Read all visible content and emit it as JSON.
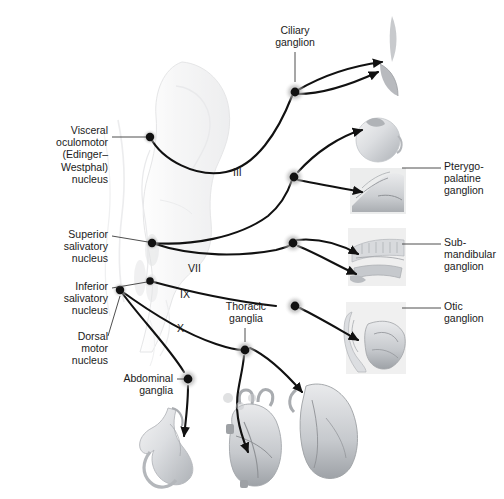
{
  "figure": {
    "background_color": "#ffffff",
    "ink_color": "#1a1a1a",
    "leader_color": "#3a3a3a",
    "anatomy_tint": "#b9bcc0"
  },
  "left_labels": [
    {
      "name": "visceral-oculomotor-nucleus",
      "text": "Visceral\noculomotor\n(Edinger–\nWestphal)\nnucleus",
      "x": 16,
      "y": 124,
      "width": 92,
      "leader": {
        "x1": 112,
        "y1": 137,
        "x2": 148,
        "y2": 137
      }
    },
    {
      "name": "superior-salivatory-nucleus",
      "text": "Superior\nsalivatory\nnucleus",
      "x": 26,
      "y": 228,
      "width": 82,
      "leader": {
        "x1": 112,
        "y1": 236,
        "x2": 151,
        "y2": 243
      }
    },
    {
      "name": "inferior-salivatory-nucleus",
      "text": "Inferior\nsalivatory\nnucleus",
      "x": 26,
      "y": 280,
      "width": 82,
      "leader": {
        "x1": 112,
        "y1": 288,
        "x2": 149,
        "y2": 281
      }
    },
    {
      "name": "dorsal-motor-nucleus",
      "text": "Dorsal\nmotor\nnucleus",
      "x": 30,
      "y": 330,
      "width": 78,
      "leader": {
        "x1": 112,
        "y1": 336,
        "x2": 121,
        "y2": 290
      }
    },
    {
      "name": "abdominal-ganglia",
      "text": "Abdominal\nganglia",
      "x": 97,
      "y": 372,
      "width": 76,
      "leader": {
        "x1": 177,
        "y1": 379,
        "x2": 186,
        "y2": 379
      }
    }
  ],
  "right_labels": [
    {
      "name": "pterygopalatine-ganglion",
      "text": "Pterygo-\npalatine\nganglion",
      "x": 444,
      "y": 160,
      "width": 60,
      "leader": {
        "x1": 400,
        "y1": 168,
        "x2": 440,
        "y2": 168
      }
    },
    {
      "name": "submandibular-ganglion",
      "text": "Sub-\nmandibular\nganglion",
      "x": 444,
      "y": 236,
      "width": 60,
      "leader": {
        "x1": 400,
        "y1": 244,
        "x2": 440,
        "y2": 244
      }
    },
    {
      "name": "otic-ganglion",
      "text": "Otic\nganglion",
      "x": 444,
      "y": 300,
      "width": 60,
      "leader": {
        "x1": 400,
        "y1": 308,
        "x2": 440,
        "y2": 308
      }
    }
  ],
  "top_labels": [
    {
      "name": "ciliary-ganglion",
      "text": "Ciliary\nganglion",
      "x": 266,
      "y": 24,
      "width": 58,
      "leader": {
        "x1": 295,
        "y1": 52,
        "x2": 295,
        "y2": 84
      }
    },
    {
      "name": "thoracic-ganglia",
      "text": "Thoracic\nganglia",
      "x": 216,
      "y": 300,
      "width": 60,
      "leader": {
        "x1": 245,
        "y1": 328,
        "x2": 245,
        "y2": 344
      }
    }
  ],
  "nerve_numerals": [
    {
      "name": "cranial-nerve-iii",
      "text": "III",
      "x": 233,
      "y": 166
    },
    {
      "name": "cranial-nerve-vii",
      "text": "VII",
      "x": 188,
      "y": 262
    },
    {
      "name": "cranial-nerve-ix",
      "text": "IX",
      "x": 180,
      "y": 288
    },
    {
      "name": "cranial-nerve-x",
      "text": "X",
      "x": 177,
      "y": 322
    }
  ],
  "ganglia_nodes": [
    {
      "name": "ciliary-ganglion-node",
      "x": 295,
      "y": 92,
      "halo": true
    },
    {
      "name": "pterygopalatine-ganglion-node",
      "x": 294,
      "y": 177,
      "halo": true
    },
    {
      "name": "submandibular-ganglion-node",
      "x": 293,
      "y": 243,
      "halo": true
    },
    {
      "name": "otic-ganglion-node",
      "x": 295,
      "y": 306,
      "halo": true
    },
    {
      "name": "thoracic-ganglion-node",
      "x": 245,
      "y": 350,
      "halo": true
    },
    {
      "name": "abdominal-ganglion-node",
      "x": 188,
      "y": 379,
      "halo": true
    }
  ],
  "nuclei_nodes": [
    {
      "name": "visceral-oculomotor-nucleus-node",
      "x": 150,
      "y": 137
    },
    {
      "name": "superior-salivatory-nucleus-node",
      "x": 152,
      "y": 243
    },
    {
      "name": "inferior-salivatory-nucleus-node",
      "x": 150,
      "y": 281
    },
    {
      "name": "dorsal-motor-nucleus-node",
      "x": 120,
      "y": 290
    }
  ],
  "organs": [
    {
      "name": "eyelid-lacrimal-gland-image",
      "x": 372,
      "y": 14,
      "w": 34,
      "h": 84
    },
    {
      "name": "eyeball-image",
      "x": 352,
      "y": 112,
      "w": 52,
      "h": 52
    },
    {
      "name": "nasal-cavity-image",
      "x": 350,
      "y": 168,
      "w": 56,
      "h": 46
    },
    {
      "name": "mandible-teeth-image",
      "x": 348,
      "y": 228,
      "w": 58,
      "h": 58
    },
    {
      "name": "ear-parotid-gland-image",
      "x": 346,
      "y": 302,
      "w": 60,
      "h": 72
    },
    {
      "name": "stomach-image",
      "x": 132,
      "y": 408,
      "w": 68,
      "h": 84
    },
    {
      "name": "heart-image",
      "x": 222,
      "y": 402,
      "w": 66,
      "h": 86
    },
    {
      "name": "lung-image",
      "x": 288,
      "y": 380,
      "w": 74,
      "h": 100
    }
  ],
  "brainstem": {
    "name": "brainstem-image",
    "x": 118,
    "y": 58,
    "w": 118,
    "h": 300
  }
}
